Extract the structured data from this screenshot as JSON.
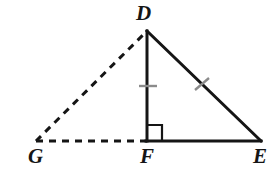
{
  "figure": {
    "type": "geometry-diagram",
    "background_color": "#ffffff",
    "stroke_color": "#151515",
    "tick_color": "#8b8b8b",
    "labels": {
      "D": "D",
      "G": "G",
      "F": "F",
      "E": "E"
    },
    "vertices": [
      {
        "name": "D",
        "x": 147,
        "y": 31
      },
      {
        "name": "G",
        "x": 36,
        "y": 141
      },
      {
        "name": "F",
        "x": 147,
        "y": 141
      },
      {
        "name": "E",
        "x": 261,
        "y": 141
      }
    ],
    "segments": [
      {
        "name": "DF",
        "from": "D",
        "to": "F",
        "style": "solid",
        "tick_marks": 1
      },
      {
        "name": "DE",
        "from": "D",
        "to": "E",
        "style": "solid",
        "tick_marks": 1
      },
      {
        "name": "FE",
        "from": "F",
        "to": "E",
        "style": "solid",
        "tick_marks": 0
      },
      {
        "name": "GD",
        "from": "G",
        "to": "D",
        "style": "dashed",
        "tick_marks": 0
      },
      {
        "name": "GF",
        "from": "G",
        "to": "F",
        "style": "dashed",
        "tick_marks": 0
      }
    ],
    "right_angle": {
      "at_vertex": "F",
      "between": "DF and FE",
      "marker": "square",
      "size": 15
    }
  }
}
